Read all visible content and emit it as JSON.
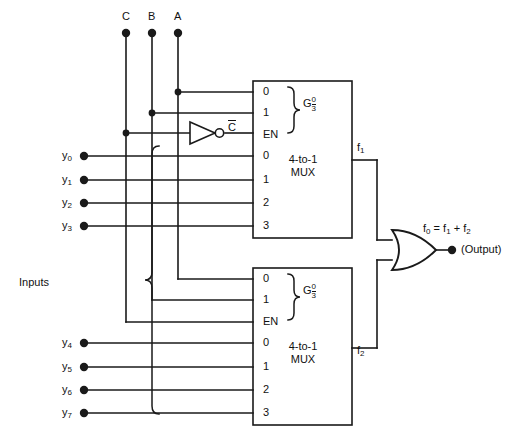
{
  "diagram": {
    "control_inputs": [
      {
        "name": "select-c",
        "label": "C",
        "x": 126,
        "y": 33
      },
      {
        "name": "select-b",
        "label": "B",
        "x": 152,
        "y": 33
      },
      {
        "name": "select-a",
        "label": "A",
        "x": 178,
        "y": 33
      }
    ],
    "inputs_brace_label": "Inputs",
    "data_inputs_top": [
      {
        "label": "y",
        "sub": "0",
        "y": 156
      },
      {
        "label": "y",
        "sub": "1",
        "y": 180
      },
      {
        "label": "y",
        "sub": "2",
        "y": 203
      },
      {
        "label": "y",
        "sub": "3",
        "y": 226
      }
    ],
    "data_inputs_bottom": [
      {
        "label": "y",
        "sub": "4",
        "y": 343
      },
      {
        "label": "y",
        "sub": "5",
        "y": 367
      },
      {
        "label": "y",
        "sub": "6",
        "y": 390
      },
      {
        "label": "y",
        "sub": "7",
        "y": 413
      }
    ],
    "inverter": {
      "name": "not-gate-c",
      "output_label": "C",
      "overline": true
    },
    "mux_top": {
      "name": "mux-top",
      "title_line1": "4-to-1",
      "title_line2": "MUX",
      "select_pins": [
        "0",
        "1"
      ],
      "group_symbol": "G",
      "group_num": "0",
      "group_den": "3",
      "enable_pin": "EN",
      "data_pins": [
        "0",
        "1",
        "2",
        "3"
      ],
      "output_label": "f",
      "output_sub": "1"
    },
    "mux_bottom": {
      "name": "mux-bottom",
      "title_line1": "4-to-1",
      "title_line2": "MUX",
      "select_pins": [
        "0",
        "1"
      ],
      "group_symbol": "G",
      "group_num": "0",
      "group_den": "3",
      "enable_pin": "EN",
      "data_pins": [
        "0",
        "1",
        "2",
        "3"
      ],
      "output_label": "f",
      "output_sub": "2"
    },
    "or_gate": {
      "name": "or-gate",
      "equation_f0": "f",
      "equation_f0_sub": "0",
      "equation_eq": "=",
      "equation_f1": "f",
      "equation_f1_sub": "1",
      "equation_plus": "+",
      "equation_f2": "f",
      "equation_f2_sub": "2",
      "output_caption": "(Output)"
    },
    "colors": {
      "line": "#1a1a1a",
      "text": "#111111",
      "background": "#ffffff"
    }
  }
}
